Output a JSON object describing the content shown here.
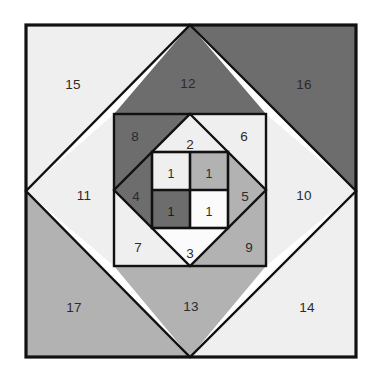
{
  "figure": {
    "background_color": "#ffffff",
    "stroke_color": "#111111",
    "palette": {
      "white": "#fbfbfb",
      "light_gray": "#efefef",
      "medium_gray": "#b2b2b2",
      "dark_gray": "#6d6d6d"
    },
    "geometry": {
      "outer_square": {
        "x": 26,
        "y": 25,
        "size": 330
      },
      "outer_diamond_vertices": "190,26 356,191 190,357 25,191",
      "middle_square": {
        "x": 114,
        "y": 114,
        "size": 152
      },
      "middle_diamond_vertices": "190,114 266,190 190,266 114,190",
      "inner_square": {
        "x": 152,
        "y": 152,
        "size": 76
      },
      "inner_cell_size": 38
    }
  },
  "regions": [
    {
      "id": "r1-tl",
      "label": "1",
      "fill": "light_gray",
      "label_x": 171,
      "label_y": 174
    },
    {
      "id": "r1-tr",
      "label": "1",
      "fill": "medium_gray",
      "label_x": 209,
      "label_y": 174
    },
    {
      "id": "r1-bl",
      "label": "1",
      "fill": "dark_gray",
      "label_x": 171,
      "label_y": 212
    },
    {
      "id": "r1-br",
      "label": "1",
      "fill": "white",
      "label_x": 209,
      "label_y": 212
    },
    {
      "id": "r2",
      "label": "2",
      "fill": "light_gray",
      "label_x": 190,
      "label_y": 144
    },
    {
      "id": "r3",
      "label": "3",
      "fill": "white",
      "label_x": 190,
      "label_y": 253
    },
    {
      "id": "r4",
      "label": "4",
      "fill": "dark_gray",
      "label_x": 136,
      "label_y": 196
    },
    {
      "id": "r5",
      "label": "5",
      "fill": "medium_gray",
      "label_x": 245,
      "label_y": 196
    },
    {
      "id": "r6",
      "label": "6",
      "fill": "light_gray",
      "label_x": 244,
      "label_y": 136
    },
    {
      "id": "r7",
      "label": "7",
      "fill": "light_gray",
      "label_x": 138,
      "label_y": 247
    },
    {
      "id": "r8",
      "label": "8",
      "fill": "dark_gray",
      "label_x": 135,
      "label_y": 136
    },
    {
      "id": "r9",
      "label": "9",
      "fill": "medium_gray",
      "label_x": 249,
      "label_y": 247
    },
    {
      "id": "r10",
      "label": "10",
      "fill": "light_gray",
      "label_x": 303,
      "label_y": 195
    },
    {
      "id": "r11",
      "label": "11",
      "fill": "light_gray",
      "label_x": 84,
      "label_y": 195
    },
    {
      "id": "r12",
      "label": "12",
      "fill": "dark_gray",
      "label_x": 188,
      "label_y": 83
    },
    {
      "id": "r13",
      "label": "13",
      "fill": "medium_gray",
      "label_x": 191,
      "label_y": 306
    },
    {
      "id": "r14",
      "label": "14",
      "fill": "light_gray",
      "label_x": 306,
      "label_y": 307
    },
    {
      "id": "r15",
      "label": "15",
      "fill": "light_gray",
      "label_x": 73,
      "label_y": 84
    },
    {
      "id": "r16",
      "label": "16",
      "fill": "dark_gray",
      "label_x": 303,
      "label_y": 84
    },
    {
      "id": "r17",
      "label": "17",
      "fill": "medium_gray",
      "label_x": 74,
      "label_y": 307
    }
  ]
}
